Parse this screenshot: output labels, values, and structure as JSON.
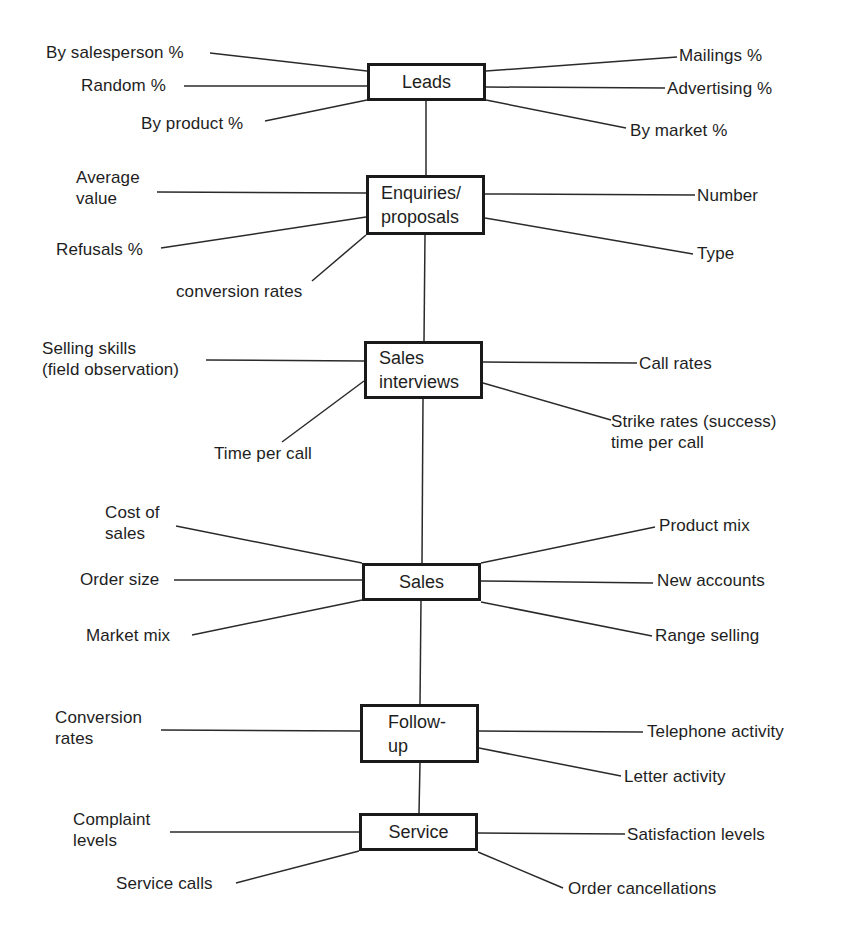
{
  "stages": {
    "leads": {
      "label": "Leads",
      "left": [
        "By salesperson %",
        "Random %",
        "By product %"
      ],
      "right": [
        "Mailings %",
        "Advertising %",
        "By market %"
      ]
    },
    "enquiries": {
      "label": "Enquiries/\nproposals",
      "left": [
        "Average\nvalue",
        "Refusals %",
        "conversion rates"
      ],
      "right": [
        "Number",
        "Type"
      ]
    },
    "interviews": {
      "label": "Sales\ninterviews",
      "left": [
        "Selling skills\n(field observation)",
        "Time per call"
      ],
      "right": [
        "Call rates",
        "Strike rates (success)\ntime per call"
      ]
    },
    "sales": {
      "label": "Sales",
      "left": [
        "Cost of\nsales",
        "Order size",
        "Market mix"
      ],
      "right": [
        "Product mix",
        "New accounts",
        "Range selling"
      ]
    },
    "followup": {
      "label": "Follow-\nup",
      "left": [
        "Conversion\nrates"
      ],
      "right": [
        "Telephone activity",
        "Letter activity"
      ]
    },
    "service": {
      "label": "Service",
      "left": [
        "Complaint\nlevels",
        "Service calls"
      ],
      "right": [
        "Satisfaction levels",
        "Order cancellations"
      ]
    }
  },
  "colors": {
    "line": "#2a2a2a",
    "text": "#1e1e1e",
    "box_border": "#1a1a1a",
    "background": "#ffffff"
  }
}
